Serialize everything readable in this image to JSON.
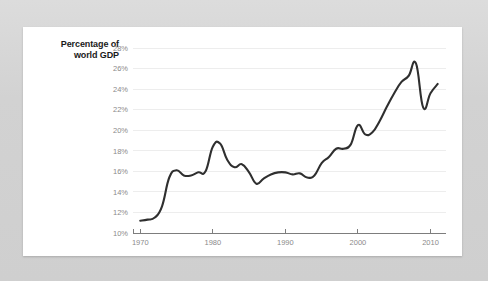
{
  "card": {
    "background_color": "#ffffff",
    "page_background_color": "#d3d3d3"
  },
  "chart_data": {
    "type": "line",
    "title": "",
    "subtitle": "",
    "xlabel": "",
    "ylabel": "Percentage of world GDP",
    "ylabel_line1": "Percentage of",
    "ylabel_line2": "world GDP",
    "grid": true,
    "legend": false,
    "legend_position": "none",
    "line_color": "#2f2f2f",
    "grid_color": "#ededed",
    "axis_color": "#7d7d7d",
    "tick_label_color": "#8a8a8a",
    "xlim": [
      1969,
      2012
    ],
    "ylim": [
      10,
      28
    ],
    "y_ticks": [
      10,
      12,
      14,
      16,
      18,
      20,
      22,
      24,
      26,
      28
    ],
    "y_tick_labels": [
      "10%",
      "12%",
      "14%",
      "16%",
      "18%",
      "20%",
      "22%",
      "24%",
      "26%",
      "28%"
    ],
    "x_ticks": [
      1970,
      1980,
      1990,
      2000,
      2010
    ],
    "x_tick_labels": [
      "1970",
      "1980",
      "1990",
      "2000",
      "2010"
    ],
    "series": [
      {
        "name": "World trade as percentage of world GDP",
        "x": [
          1970,
          1971,
          1972,
          1973,
          1974,
          1975,
          1976,
          1977,
          1978,
          1979,
          1980,
          1981,
          1982,
          1983,
          1984,
          1985,
          1986,
          1987,
          1988,
          1989,
          1990,
          1991,
          1992,
          1993,
          1994,
          1995,
          1996,
          1997,
          1998,
          1999,
          2000,
          2001,
          2002,
          2003,
          2004,
          2005,
          2006,
          2007,
          2008,
          2009,
          2010,
          2011
        ],
        "values": [
          11.2,
          11.3,
          11.5,
          12.6,
          15.4,
          16.1,
          15.6,
          15.6,
          15.9,
          16.0,
          18.4,
          18.7,
          17.1,
          16.4,
          16.7,
          15.9,
          14.8,
          15.3,
          15.7,
          15.9,
          15.9,
          15.7,
          15.8,
          15.4,
          15.6,
          16.8,
          17.4,
          18.2,
          18.2,
          18.6,
          20.5,
          19.6,
          19.8,
          20.9,
          22.3,
          23.6,
          24.7,
          25.3,
          26.5,
          22.2,
          23.6,
          24.5
        ]
      }
    ]
  },
  "y_axis_title": {
    "line1": "Percentage of",
    "line2": "world GDP"
  }
}
